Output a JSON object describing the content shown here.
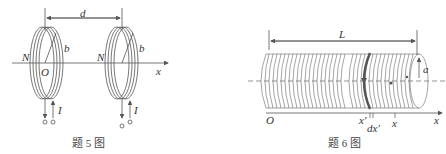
{
  "figure5": {
    "caption": "题 5 图",
    "labels": {
      "distance": "d",
      "radius": "b",
      "turns_left": "N",
      "turns_right": "N",
      "origin": "O",
      "axis": "x",
      "current_left": "I",
      "current_right": "I"
    }
  },
  "figure6": {
    "caption": "题 6 图",
    "labels": {
      "length": "L",
      "radius": "a",
      "origin": "O",
      "axis": "x",
      "x_prime": "x′",
      "dx_prime": "dx′",
      "x_point": "x"
    }
  },
  "colors": {
    "line": "#555555",
    "text": "#333333",
    "ring_highlight": "#555555"
  }
}
